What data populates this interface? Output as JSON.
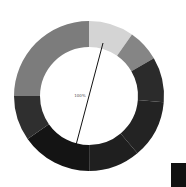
{
  "chart_data": {
    "type": "pie",
    "variant": "donut",
    "title": "",
    "center_label": "100%",
    "categories": [
      "S1",
      "S2",
      "S3",
      "S4",
      "S5",
      "S6",
      "S7",
      "S8"
    ],
    "values": [
      9.7,
      6.9,
      9.7,
      12.5,
      11.1,
      15.3,
      9.7,
      25.0
    ],
    "colors": [
      "#d4d4d4",
      "#858585",
      "#2b2b2b",
      "#232323",
      "#1f1f1f",
      "#141414",
      "#2f2f2f",
      "#7c7c7c"
    ],
    "start_angle_deg": 0,
    "direction": "clockwise",
    "center": [
      89,
      96
    ],
    "outer_radius": 75,
    "inner_radius": 49,
    "pointer_line": {
      "x1": 103,
      "y1": 43,
      "x2": 76,
      "y2": 145,
      "color": "#111111"
    },
    "legend": {
      "position": "bottom-right",
      "swatch_color": "#111111"
    }
  }
}
